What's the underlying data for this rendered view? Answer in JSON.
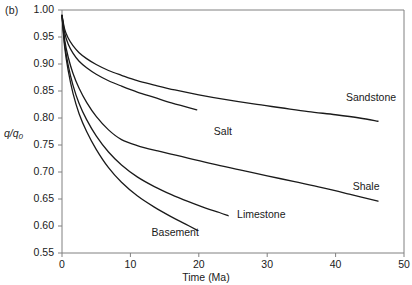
{
  "figure": {
    "panel_label": "(b)",
    "ylabel_main": "q",
    "ylabel_slash": "/",
    "ylabel_den": "q",
    "ylabel_sub": "0",
    "xlabel": "Time (Ma)"
  },
  "chart_data": {
    "type": "line",
    "title": "",
    "xlabel": "Time (Ma)",
    "ylabel": "q / q0",
    "xlim": [
      0,
      50
    ],
    "ylim": [
      0.55,
      1.0
    ],
    "xticks": [
      "0",
      "10",
      "20",
      "30",
      "40",
      "50"
    ],
    "xtick_values": [
      0,
      10,
      20,
      30,
      40,
      50
    ],
    "yticks": [
      "0.55",
      "0.60",
      "0.65",
      "0.70",
      "0.75",
      "0.80",
      "0.85",
      "0.90",
      "0.95",
      "1.00"
    ],
    "ytick_values": [
      0.55,
      0.6,
      0.65,
      0.7,
      0.75,
      0.8,
      0.85,
      0.9,
      0.95,
      1.0
    ],
    "grid": false,
    "legend": "inline-annotations",
    "line_color": "#1a1a1a",
    "series": [
      {
        "name": "Sandstone",
        "label_x": 41.5,
        "label_y": 0.838,
        "x": [
          0,
          0.4,
          0.9,
          1.6,
          2.5,
          3.6,
          5.0,
          6.8,
          8.7,
          11.0,
          13.5,
          16.5,
          20.0,
          24.0,
          28.0,
          32.0,
          36.0,
          40.0,
          43.5,
          46.2
        ],
        "values": [
          0.99,
          0.964,
          0.948,
          0.934,
          0.921,
          0.91,
          0.899,
          0.888,
          0.879,
          0.869,
          0.861,
          0.852,
          0.843,
          0.834,
          0.826,
          0.819,
          0.812,
          0.806,
          0.8,
          0.794
        ]
      },
      {
        "name": "Salt",
        "label_x": 22.2,
        "label_y": 0.775,
        "x": [
          0,
          0.4,
          0.9,
          1.6,
          2.5,
          3.6,
          5.0,
          6.8,
          8.7,
          11.0,
          13.5,
          16.0,
          18.0,
          19.7
        ],
        "values": [
          0.99,
          0.957,
          0.937,
          0.92,
          0.905,
          0.893,
          0.881,
          0.869,
          0.859,
          0.848,
          0.838,
          0.828,
          0.821,
          0.815
        ]
      },
      {
        "name": "Shale",
        "label_x": 42.5,
        "label_y": 0.672,
        "x": [
          0,
          0.4,
          0.9,
          1.6,
          2.5,
          3.6,
          5.0,
          6.8,
          8.7,
          11.0,
          14.0,
          18.0,
          22.0,
          26.0,
          30.0,
          34.0,
          38.0,
          42.0,
          46.2
        ],
        "values": [
          0.99,
          0.944,
          0.913,
          0.883,
          0.855,
          0.829,
          0.803,
          0.778,
          0.76,
          0.749,
          0.739,
          0.727,
          0.715,
          0.704,
          0.693,
          0.682,
          0.671,
          0.659,
          0.646
        ]
      },
      {
        "name": "Limestone",
        "label_x": 25.6,
        "label_y": 0.62,
        "x": [
          0,
          0.4,
          0.9,
          1.6,
          2.5,
          3.6,
          5.0,
          6.8,
          8.7,
          11.0,
          13.5,
          16.0,
          18.5,
          21.0,
          23.0,
          24.3
        ],
        "values": [
          0.99,
          0.936,
          0.898,
          0.861,
          0.827,
          0.797,
          0.767,
          0.737,
          0.713,
          0.691,
          0.673,
          0.658,
          0.645,
          0.633,
          0.625,
          0.619
        ]
      },
      {
        "name": "Basement",
        "label_x": 13.1,
        "label_y": 0.588,
        "x": [
          0,
          0.4,
          0.9,
          1.6,
          2.5,
          3.6,
          5.0,
          6.8,
          8.7,
          11.0,
          13.5,
          16.0,
          18.0,
          19.8
        ],
        "values": [
          0.99,
          0.93,
          0.888,
          0.846,
          0.808,
          0.775,
          0.742,
          0.708,
          0.681,
          0.656,
          0.635,
          0.617,
          0.604,
          0.592
        ]
      }
    ]
  }
}
